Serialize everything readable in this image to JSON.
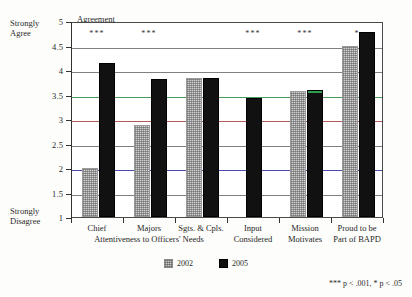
{
  "axis": {
    "top_caption": "Strongly\nAgree",
    "top_caption_line1": "Strongly",
    "top_caption_line2": "Agree",
    "bottom_caption_line1": "Strongly",
    "bottom_caption_line2": "Disagree",
    "plot_title": "Agreement",
    "ticks": [
      "5",
      "4.5",
      "4",
      "3.5",
      "3",
      "2.5",
      "2",
      "1.5",
      "1"
    ]
  },
  "legend": {
    "items": [
      {
        "label": "2002",
        "color": "#d2d2d2"
      },
      {
        "label": "2005",
        "color": "#111111"
      }
    ]
  },
  "footnote": "*** p < .001, * p < .05",
  "groups": [
    {
      "label_line1": "Attentiveness to Officers' Needs"
    },
    {
      "label_line1": ""
    }
  ],
  "chart_data": {
    "type": "bar",
    "title": "Agreement",
    "xlabel": "",
    "ylabel": "Agreement",
    "ylim": [
      1,
      5
    ],
    "yticks": [
      1,
      1.5,
      2,
      2.5,
      3,
      3.5,
      4,
      4.5,
      5
    ],
    "y_axis_low_label": "Strongly Disagree",
    "y_axis_high_label": "Strongly Agree",
    "grid": true,
    "legend_position": "bottom",
    "categories": [
      "Chief",
      "Majors",
      "Sgts. & Cpls.",
      "Input Considered",
      "Mission Motivates",
      "Proud to be Part of BAPD"
    ],
    "category_labels": [
      {
        "line1": "Chief",
        "line2": ""
      },
      {
        "line1": "Majors",
        "line2": ""
      },
      {
        "line1": "Sgts. & Cpls.",
        "line2": ""
      },
      {
        "line1": "Input",
        "line2": "Considered"
      },
      {
        "line1": "Mission",
        "line2": "Motivates"
      },
      {
        "line1": "Proud to be",
        "line2": "Part of BAPD"
      }
    ],
    "group_brackets": [
      {
        "label": "Attentiveness to Officers' Needs",
        "spans": [
          0,
          1,
          2
        ]
      }
    ],
    "series": [
      {
        "name": "2002",
        "values": [
          2.0,
          2.88,
          3.84,
          null,
          3.58,
          4.5
        ]
      },
      {
        "name": "2005",
        "values": [
          4.15,
          3.82,
          3.83,
          3.43,
          3.6,
          4.77
        ]
      }
    ],
    "significance": [
      "***",
      "***",
      "",
      "***",
      "***",
      "*"
    ],
    "significance_note": "*** p < .001, * p < .05"
  }
}
